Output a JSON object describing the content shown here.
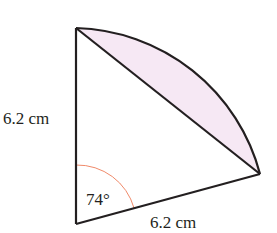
{
  "diagram": {
    "type": "sector-with-segment",
    "labels": {
      "left_side": "6.2 cm",
      "bottom_side": "6.2 cm",
      "angle": "74°"
    },
    "values": {
      "radius_cm": 6.2,
      "angle_deg": 74
    },
    "colors": {
      "stroke": "#231f20",
      "segment_fill": "#f6e8f4",
      "angle_arc": "#f08a6a"
    }
  }
}
